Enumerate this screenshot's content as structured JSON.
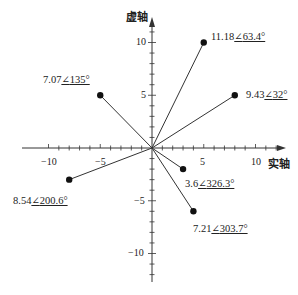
{
  "diagram": {
    "type": "complex-plane-phasor-diagram",
    "axes": {
      "x_title": "实轴",
      "y_title": "虚轴",
      "x_ticks": [
        {
          "value": -10,
          "label": "−10"
        },
        {
          "value": -5,
          "label": "−5"
        },
        {
          "value": 5,
          "label": "5"
        },
        {
          "value": 10,
          "label": "10"
        }
      ],
      "y_ticks": [
        {
          "value": 10,
          "label": "10"
        },
        {
          "value": 5,
          "label": "5"
        },
        {
          "value": -5,
          "label": "−5"
        },
        {
          "value": -10,
          "label": "−10"
        }
      ],
      "x_range": [
        -12,
        12
      ],
      "y_range": [
        -12,
        12
      ],
      "minor_tick_step": 1
    },
    "phasors": [
      {
        "re": 5,
        "im": 10,
        "magnitude": "11.18",
        "angle": "63.4°"
      },
      {
        "re": 8,
        "im": 5,
        "magnitude": "9.43",
        "angle": "32°"
      },
      {
        "re": -5,
        "im": 5,
        "magnitude": "7.07",
        "angle": "135°"
      },
      {
        "re": -8,
        "im": -3,
        "magnitude": "8.54",
        "angle": "200.6°"
      },
      {
        "re": 3,
        "im": -2,
        "magnitude": "3.6",
        "angle": "326.3°"
      },
      {
        "re": 4,
        "im": -6,
        "magnitude": "7.21",
        "angle": "303.7°"
      }
    ],
    "colors": {
      "line": "#333333",
      "point": "#111111",
      "text": "#222222"
    }
  }
}
